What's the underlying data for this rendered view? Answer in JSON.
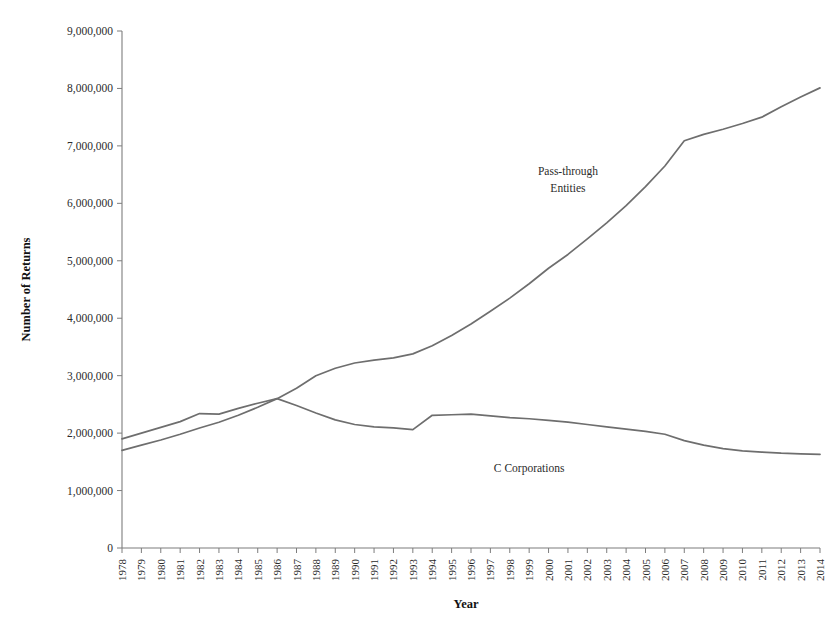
{
  "chart_data": {
    "type": "line",
    "title": "",
    "xlabel": "Year",
    "ylabel": "Number of Returns",
    "grid": false,
    "legend_position": "inline-annotation",
    "xlim": [
      1978,
      2014
    ],
    "ylim": [
      0,
      9000000
    ],
    "ytick_step": 1000000,
    "ytick_labels": [
      "0",
      "1,000,000",
      "2,000,000",
      "3,000,000",
      "4,000,000",
      "5,000,000",
      "6,000,000",
      "7,000,000",
      "8,000,000",
      "9,000,000"
    ],
    "ytick_values": [
      0,
      1000000,
      2000000,
      3000000,
      4000000,
      5000000,
      6000000,
      7000000,
      8000000,
      9000000
    ],
    "x": [
      1978,
      1979,
      1980,
      1981,
      1982,
      1983,
      1984,
      1985,
      1986,
      1987,
      1988,
      1989,
      1990,
      1991,
      1992,
      1993,
      1994,
      1995,
      1996,
      1997,
      1998,
      1999,
      2000,
      2001,
      2002,
      2003,
      2004,
      2005,
      2006,
      2007,
      2008,
      2009,
      2010,
      2011,
      2012,
      2013,
      2014
    ],
    "categories": [
      "1978",
      "1979",
      "1980",
      "1981",
      "1982",
      "1983",
      "1984",
      "1985",
      "1986",
      "1987",
      "1988",
      "1989",
      "1990",
      "1991",
      "1992",
      "1993",
      "1994",
      "1995",
      "1996",
      "1997",
      "1998",
      "1999",
      "2000",
      "2001",
      "2002",
      "2003",
      "2004",
      "2005",
      "2006",
      "2007",
      "2008",
      "2009",
      "2010",
      "2011",
      "2012",
      "2013",
      "2014"
    ],
    "series": [
      {
        "name": "Pass-through Entities",
        "label_line1": "Pass-through",
        "label_line2": "Entities",
        "color": "#6e6e6e",
        "values": [
          1700000,
          1790000,
          1880000,
          1980000,
          2090000,
          2190000,
          2310000,
          2450000,
          2600000,
          2780000,
          3000000,
          3130000,
          3220000,
          3270000,
          3310000,
          3380000,
          3520000,
          3700000,
          3900000,
          4120000,
          4350000,
          4600000,
          4870000,
          5110000,
          5380000,
          5660000,
          5960000,
          6290000,
          6650000,
          7090000,
          7200000,
          7290000,
          7390000,
          7500000,
          7680000,
          7850000,
          8010000
        ]
      },
      {
        "name": "C Corporations",
        "label_line1": "C Corporations",
        "label_line2": "",
        "color": "#6e6e6e",
        "values": [
          1900000,
          2000000,
          2100000,
          2200000,
          2340000,
          2330000,
          2430000,
          2520000,
          2600000,
          2480000,
          2350000,
          2230000,
          2150000,
          2110000,
          2090000,
          2060000,
          2310000,
          2320000,
          2330000,
          2300000,
          2270000,
          2250000,
          2220000,
          2190000,
          2150000,
          2110000,
          2070000,
          2030000,
          1980000,
          1870000,
          1790000,
          1730000,
          1690000,
          1670000,
          1650000,
          1640000,
          1630000
        ]
      }
    ],
    "annotations": [
      {
        "text": "Pass-through Entities",
        "x": 2001,
        "y": 6500000
      },
      {
        "text": "C Corporations",
        "x": 1999,
        "y": 1330000
      }
    ]
  }
}
